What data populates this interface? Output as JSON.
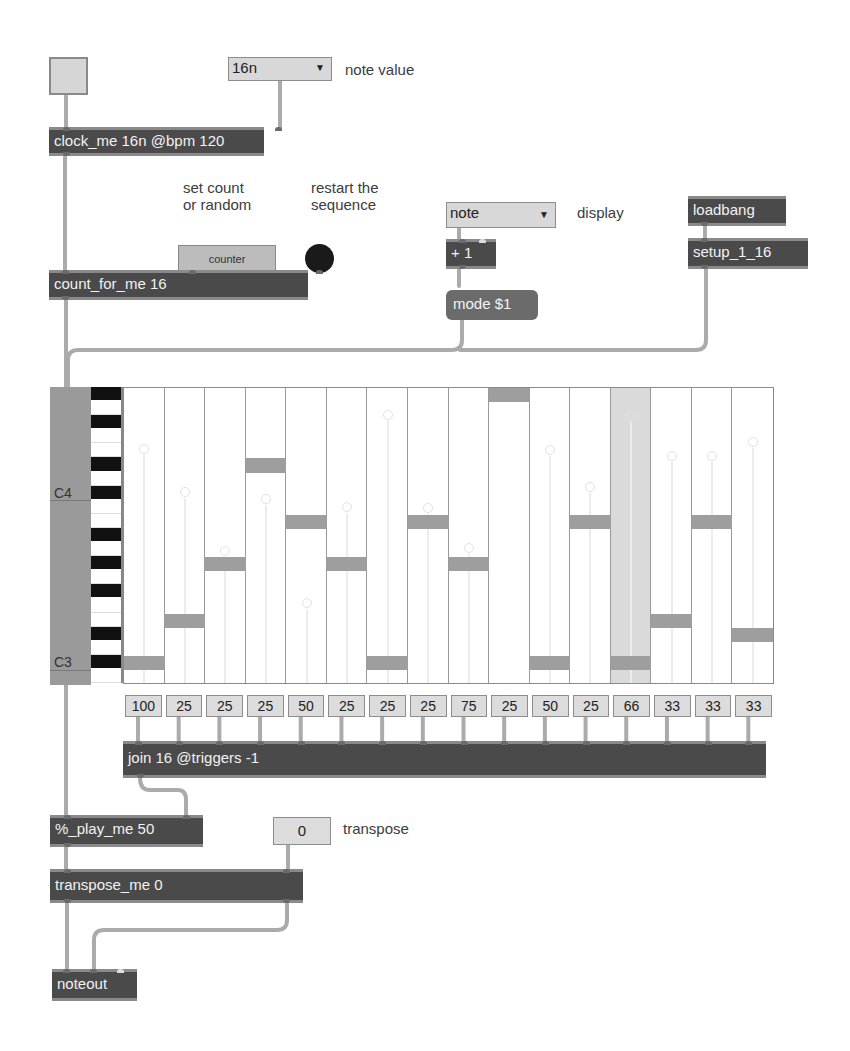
{
  "toggle": {
    "state": "off"
  },
  "note_value_menu": {
    "selected": "16n",
    "label": "note value"
  },
  "clock_object": "clock_me 16n @bpm 120",
  "comments": {
    "set_count": "set count\nor random",
    "restart": "restart the\nsequence",
    "display": "display",
    "transpose": "transpose",
    "note_value": "note value"
  },
  "counter_button": "counter",
  "restart_button": {
    "icon": "bang-icon"
  },
  "count_object": "count_for_me 16",
  "display_menu": {
    "selected": "note"
  },
  "plus_object": "+ 1",
  "mode_message": "mode $1",
  "loadbang_object": "loadbang",
  "setup_object": "setup_1_16",
  "piano_roll": {
    "label_top": "C4",
    "label_bottom": "C3",
    "rows": 21,
    "steps": 16,
    "current_step": 13,
    "notes_rows_from_bottom": [
      1,
      4,
      8,
      15,
      11,
      8,
      1,
      11,
      8,
      20,
      1,
      11,
      1,
      4,
      11,
      3
    ],
    "velocity_handles_y": [
      448,
      491,
      550,
      498,
      602,
      506,
      414,
      507,
      547,
      0,
      449,
      486,
      415,
      455,
      455,
      441
    ]
  },
  "probabilities": [
    "100",
    "25",
    "25",
    "25",
    "50",
    "25",
    "25",
    "25",
    "75",
    "25",
    "50",
    "25",
    "66",
    "33",
    "33",
    "33"
  ],
  "join_object": "join 16 @triggers -1",
  "play_object": "%_play_me 50",
  "transpose_number": "0",
  "transpose_object": "transpose_me 0",
  "noteout_object": "noteout"
}
